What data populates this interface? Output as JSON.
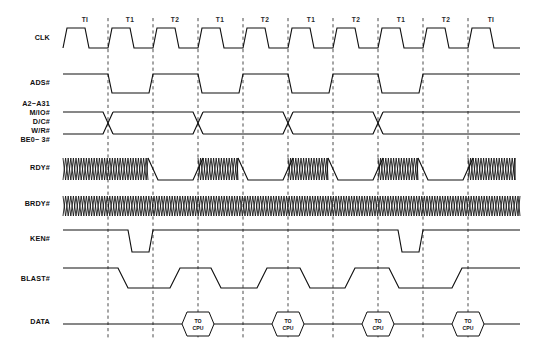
{
  "diagram": {
    "background_color": "#ffffff",
    "line_color": "#101010",
    "grid_color": "#2b2b2b",
    "width": 535,
    "height": 349
  },
  "phase_labels": [
    {
      "text": "TI",
      "x": 85
    },
    {
      "text": "T1",
      "x": 130
    },
    {
      "text": "T2",
      "x": 175
    },
    {
      "text": "T1",
      "x": 220
    },
    {
      "text": "T2",
      "x": 265
    },
    {
      "text": "T1",
      "x": 311
    },
    {
      "text": "T2",
      "x": 356
    },
    {
      "text": "T1",
      "x": 401
    },
    {
      "text": "T2",
      "x": 446
    },
    {
      "text": "TI",
      "x": 491
    }
  ],
  "gridlines_x": [
    108,
    153,
    198,
    243,
    288,
    333,
    378,
    423,
    468
  ],
  "signals": [
    {
      "name": "CLK",
      "label": "CLK",
      "label_x": 50,
      "label_y": 40,
      "type": "clock"
    },
    {
      "name": "ADS#",
      "label": "ADS#",
      "label_x": 50,
      "label_y": 85,
      "type": "level"
    },
    {
      "name": "A2-A31",
      "label": "A2−A31",
      "label_x": 50,
      "label_y": 106,
      "type": "bus"
    },
    {
      "name": "M/IO#",
      "label": "M/IO#",
      "label_x": 50,
      "label_y": 115,
      "type": "bus-label-only"
    },
    {
      "name": "D/C#",
      "label": "D/C#",
      "label_x": 50,
      "label_y": 124,
      "type": "bus-label-only"
    },
    {
      "name": "W/R#",
      "label": "W/R#",
      "label_x": 50,
      "label_y": 133,
      "type": "bus-label-only"
    },
    {
      "name": "BE0-3#",
      "label": "BE0− 3#",
      "label_x": 50,
      "label_y": 142,
      "type": "bus-label-only"
    },
    {
      "name": "RDY#",
      "label": "RDY#",
      "label_x": 50,
      "label_y": 170,
      "type": "hatched"
    },
    {
      "name": "BRDY#",
      "label": "BRDY#",
      "label_x": 50,
      "label_y": 206,
      "type": "hatched-full"
    },
    {
      "name": "KEN#",
      "label": "KEN#",
      "label_x": 50,
      "label_y": 241,
      "type": "level"
    },
    {
      "name": "BLAST#",
      "label": "BLAST#",
      "label_x": 50,
      "label_y": 281,
      "type": "level"
    },
    {
      "name": "DATA",
      "label": "DATA",
      "label_x": 50,
      "label_y": 324,
      "type": "data"
    }
  ],
  "clock": {
    "y_high": 28,
    "y_low": 48,
    "start_x": 63,
    "end_x": 520,
    "period": 45,
    "first_rise": 63,
    "slew": 4,
    "high_width": 18,
    "cycles": 10
  },
  "ads": {
    "y_high": 74,
    "y_low": 93,
    "start_x": 63,
    "end_x": 520,
    "low_windows": [
      [
        108,
        153
      ],
      [
        198,
        243
      ],
      [
        288,
        333
      ],
      [
        378,
        423
      ]
    ]
  },
  "bus": {
    "y_top": 112,
    "y_bottom": 134,
    "start_x": 63,
    "end_x": 520,
    "crossings": [
      108,
      198,
      288,
      378
    ]
  },
  "rdy": {
    "y_high": 158,
    "y_low": 180,
    "start_x": 63,
    "end_x": 520,
    "low_windows": [
      [
        153,
        198
      ],
      [
        243,
        288
      ],
      [
        333,
        378
      ],
      [
        423,
        468
      ]
    ]
  },
  "brdy": {
    "y_high": 196,
    "y_low": 216,
    "start_x": 63,
    "end_x": 520
  },
  "ken": {
    "y_high": 230,
    "y_low": 252,
    "start_x": 63,
    "end_x": 520,
    "low_windows": [
      [
        128,
        153
      ],
      [
        398,
        423
      ]
    ]
  },
  "blast": {
    "y_high": 268,
    "y_low": 288,
    "start_x": 63,
    "end_x": 520,
    "segments": [
      {
        "from": 63,
        "to": 123,
        "level": "high"
      },
      {
        "from": 123,
        "to": 175,
        "level": "low"
      },
      {
        "from": 175,
        "to": 216,
        "level": "high"
      },
      {
        "from": 216,
        "to": 262,
        "level": "low"
      },
      {
        "from": 262,
        "to": 305,
        "level": "high"
      },
      {
        "from": 305,
        "to": 350,
        "level": "low"
      },
      {
        "from": 350,
        "to": 394,
        "level": "high"
      },
      {
        "from": 394,
        "to": 457,
        "level": "low"
      },
      {
        "from": 457,
        "to": 520,
        "level": "high"
      }
    ]
  },
  "data": {
    "y_center": 324,
    "start_x": 63,
    "end_x": 520,
    "bubbles": [
      {
        "cx": 198,
        "label_top": "TO",
        "label_bottom": "CPU"
      },
      {
        "cx": 288,
        "label_top": "TO",
        "label_bottom": "CPU"
      },
      {
        "cx": 378,
        "label_top": "TO",
        "label_bottom": "CPU"
      },
      {
        "cx": 468,
        "label_top": "TO",
        "label_bottom": "CPU"
      }
    ],
    "bubble_half_width": 16,
    "bubble_half_height": 12,
    "bubble_notch": 5
  },
  "chart_data": {
    "type": "table",
    "xlabel": "Clock Phase",
    "ylabel": "Signal",
    "categories": [
      "TI",
      "T1",
      "T2",
      "T1",
      "T2",
      "T1",
      "T2",
      "T1",
      "T2",
      "TI"
    ],
    "series": [
      {
        "name": "CLK",
        "values": [
          "square-wave",
          "square-wave",
          "square-wave",
          "square-wave",
          "square-wave",
          "square-wave",
          "square-wave",
          "square-wave",
          "square-wave",
          "square-wave"
        ]
      },
      {
        "name": "ADS#",
        "values": [
          "high",
          "low",
          "high",
          "low",
          "high",
          "low",
          "high",
          "low",
          "high",
          "high"
        ]
      },
      {
        "name": "A2-A31/M/IO#/D/C#/W/R#/BE0-3#",
        "values": [
          "valid",
          "valid",
          "valid",
          "valid",
          "valid",
          "valid",
          "valid",
          "valid",
          "valid",
          "valid"
        ]
      },
      {
        "name": "RDY#",
        "values": [
          "dont-care",
          "dont-care",
          "low",
          "dont-care",
          "low",
          "dont-care",
          "low",
          "dont-care",
          "low",
          "dont-care"
        ]
      },
      {
        "name": "BRDY#",
        "values": [
          "dont-care",
          "dont-care",
          "dont-care",
          "dont-care",
          "dont-care",
          "dont-care",
          "dont-care",
          "dont-care",
          "dont-care",
          "dont-care"
        ]
      },
      {
        "name": "KEN#",
        "values": [
          "high",
          "low",
          "high",
          "high",
          "high",
          "high",
          "high",
          "low",
          "high",
          "high"
        ]
      },
      {
        "name": "BLAST#",
        "values": [
          "high",
          "low",
          "high",
          "low",
          "high",
          "low",
          "high",
          "low",
          "low",
          "high"
        ]
      },
      {
        "name": "DATA",
        "values": [
          "idle",
          "idle",
          "TO CPU",
          "idle",
          "TO CPU",
          "idle",
          "TO CPU",
          "idle",
          "TO CPU",
          "idle"
        ]
      }
    ],
    "grid": true,
    "legend_position": "none"
  }
}
